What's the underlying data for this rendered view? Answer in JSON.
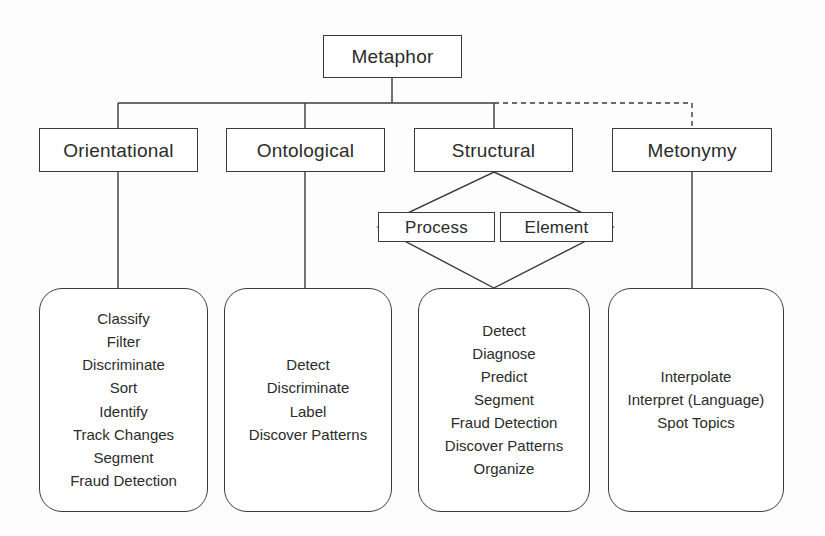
{
  "diagram": {
    "root": {
      "label": "Metaphor"
    },
    "categories": [
      {
        "label": "Orientational"
      },
      {
        "label": "Ontological"
      },
      {
        "label": "Structural"
      },
      {
        "label": "Metonymy"
      }
    ],
    "structural_children": [
      {
        "label": "Process"
      },
      {
        "label": "Element"
      }
    ],
    "task_lists": [
      {
        "for": "Orientational",
        "items": [
          "Classify",
          "Filter",
          "Discriminate",
          "Sort",
          "Identify",
          "Track Changes",
          "Segment",
          "Fraud Detection"
        ]
      },
      {
        "for": "Ontological",
        "items": [
          "Detect",
          "Discriminate",
          "Label",
          "Discover Patterns"
        ]
      },
      {
        "for": "Structural",
        "items": [
          "Detect",
          "Diagnose",
          "Predict",
          "Segment",
          "Fraud Detection",
          "Discover Patterns",
          "Organize"
        ]
      },
      {
        "for": "Metonymy",
        "items": [
          "Interpolate",
          "Interpret (Language)",
          "Spot Topics"
        ]
      }
    ],
    "colors": {
      "line": "#3a3a3a",
      "text": "#2b2b2b",
      "background": "#fdfdfd"
    },
    "connectors": {
      "solid_style": "solid",
      "metonymy_branch_style": "dashed"
    }
  }
}
